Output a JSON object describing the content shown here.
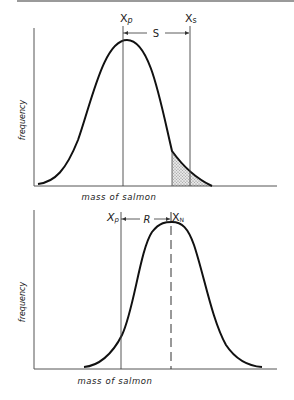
{
  "figure": {
    "top_panel": {
      "ylabel": "frequency",
      "xlabel": "mass of salmon",
      "markers": {
        "left": {
          "symbol": "X",
          "subscript": "p"
        },
        "right": {
          "symbol": "X",
          "subscript": "s"
        }
      },
      "distance_label": "S",
      "shaded_region": "upper tail of distribution beyond selection threshold"
    },
    "bottom_panel": {
      "ylabel": "frequency",
      "xlabel": "mass of salmon",
      "markers": {
        "left": {
          "symbol": "X",
          "subscript": "p"
        },
        "right": {
          "symbol": "X",
          "subscript": "N"
        }
      },
      "distance_label": "R",
      "dashed_line": "mean of new distribution"
    }
  },
  "colors": {
    "ink": "#111111",
    "axis": "#555555",
    "shade": "#bdbdbd",
    "top_border": "#9a9a9a"
  }
}
